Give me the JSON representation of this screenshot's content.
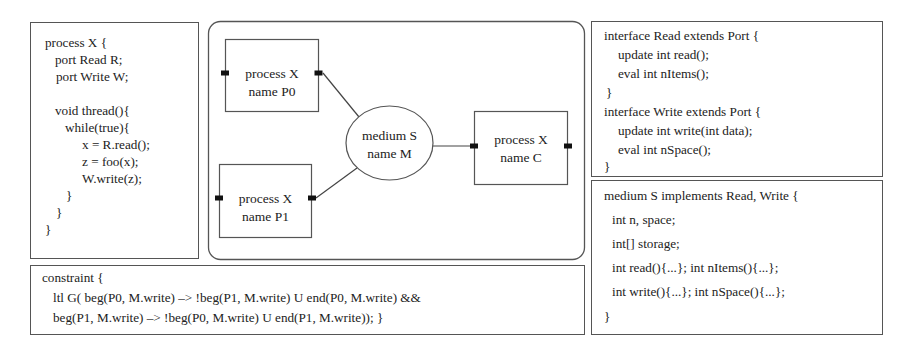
{
  "process_code": {
    "lines": [
      "process X {",
      "port Read R;",
      "port Write W;",
      "void thread(){",
      "while(true){",
      "x = R.read();",
      "z = foo(x);",
      "W.write(z);",
      "}",
      "}",
      "}"
    ]
  },
  "diagram": {
    "processes": [
      {
        "id": "P0",
        "line1": "process X",
        "line2": "name P0"
      },
      {
        "id": "P1",
        "line1": "process X",
        "line2": "name P1"
      },
      {
        "id": "C",
        "line1": "process X",
        "line2": "name C"
      }
    ],
    "medium": {
      "line1": "medium S",
      "line2": "name M"
    }
  },
  "interfaces_code": {
    "lines": [
      "interface Read extends Port {",
      "update int read();",
      "eval int nItems();",
      "}",
      "interface Write extends Port {",
      "update int write(int data);",
      "eval int nSpace();",
      "}"
    ]
  },
  "medium_code": {
    "lines": [
      "medium S implements Read, Write {",
      "int n, space;",
      "int[] storage;",
      "int read(){...}; int nItems(){...};",
      "int write(){...}; int nSpace(){...};",
      "}"
    ]
  },
  "constraint_code": {
    "lines": [
      "constraint {",
      "ltl G( beg(P0, M.write) –> !beg(P1, M.write) U end(P0, M.write) &&",
      "beg(P1, M.write) –> !beg(P0, M.write) U end(P1, M.write)); }"
    ]
  }
}
